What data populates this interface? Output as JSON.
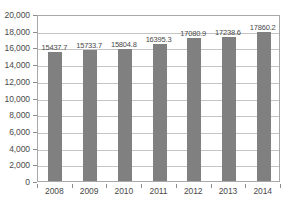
{
  "chart_data": {
    "type": "bar",
    "title": "",
    "xlabel": "",
    "ylabel": "",
    "categories": [
      "2008",
      "2009",
      "2010",
      "2011",
      "2012",
      "2013",
      "2014"
    ],
    "values": [
      15437.7,
      15733.7,
      15804.8,
      16395.3,
      17080.9,
      17238.6,
      17860.2
    ],
    "value_labels": [
      "15437.7",
      "15733.7",
      "15804.8",
      "16395.3",
      "17080.9",
      "17238.6",
      "17860.2"
    ],
    "ylim": [
      0,
      20000
    ],
    "ytick_values": [
      0,
      2000,
      4000,
      6000,
      8000,
      10000,
      12000,
      14000,
      16000,
      18000,
      20000
    ],
    "ytick_labels": [
      "0",
      "2,000",
      "4,000",
      "6,000",
      "8,000",
      "10,000",
      "12,000",
      "14,000",
      "16,000",
      "18,000",
      "20,000"
    ],
    "grid": true,
    "legend": false,
    "bar_color": "#808080",
    "gridline_color": "#c4c4c4",
    "axis_color": "#a8a8a8",
    "text_color": "#4a4a4a"
  }
}
